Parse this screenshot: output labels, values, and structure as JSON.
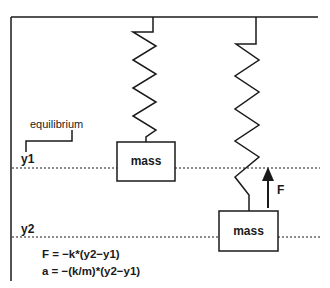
{
  "diagram": {
    "type": "spring-mass-system",
    "labels": {
      "equilibrium": "equilibrium",
      "y1": "y1",
      "y2": "y2",
      "force": "F"
    },
    "masses": [
      {
        "label": "mass",
        "position": "equilibrium"
      },
      {
        "label": "mass",
        "position": "displaced"
      }
    ],
    "equations": [
      "F = −k*(y2−y1)",
      "a = −(k/m)*(y2−y1)"
    ],
    "colors": {
      "line": "#1a1a1a",
      "background": "#ffffff"
    }
  }
}
